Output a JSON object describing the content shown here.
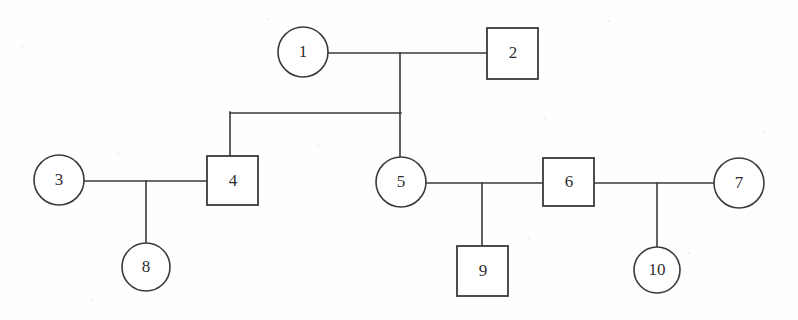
{
  "diagram": {
    "kind": "pedigree-genogram",
    "background_color": "#fefefe",
    "line_color": "#3a3a3c",
    "shape_fill": "#ffffff",
    "label_color": "#2e2e30",
    "symbol_legend": {
      "circle": "female",
      "square": "male"
    },
    "nodes": [
      {
        "id": "1",
        "label": "1",
        "shape": "circle",
        "sex": "female",
        "cx": 303,
        "cy": 52,
        "r": 25
      },
      {
        "id": "2",
        "label": "2",
        "shape": "square",
        "sex": "male",
        "x": 487,
        "y": 28,
        "w": 51,
        "h": 51
      },
      {
        "id": "3",
        "label": "3",
        "shape": "circle",
        "sex": "female",
        "cx": 59,
        "cy": 180,
        "r": 25
      },
      {
        "id": "4",
        "label": "4",
        "shape": "square",
        "sex": "male",
        "x": 207,
        "y": 156,
        "w": 51,
        "h": 49
      },
      {
        "id": "5",
        "label": "5",
        "shape": "circle",
        "sex": "female",
        "cx": 401,
        "cy": 182,
        "r": 25
      },
      {
        "id": "6",
        "label": "6",
        "shape": "square",
        "sex": "male",
        "x": 543,
        "y": 158,
        "w": 51,
        "h": 48
      },
      {
        "id": "7",
        "label": "7",
        "shape": "circle",
        "sex": "female",
        "cx": 739,
        "cy": 183,
        "r": 25
      },
      {
        "id": "8",
        "label": "8",
        "shape": "circle",
        "sex": "female",
        "cx": 146,
        "cy": 267,
        "r": 24
      },
      {
        "id": "9",
        "label": "9",
        "shape": "square",
        "sex": "male",
        "x": 457,
        "y": 246,
        "w": 51,
        "h": 50
      },
      {
        "id": "10",
        "label": "10",
        "shape": "circle",
        "sex": "female",
        "cx": 657,
        "cy": 270,
        "r": 23
      }
    ],
    "unions": [
      {
        "id": "union-1-2",
        "partners": [
          "1",
          "2"
        ],
        "children": [
          "4",
          "5"
        ]
      },
      {
        "id": "union-3-4",
        "partners": [
          "3",
          "4"
        ],
        "children": [
          "8"
        ]
      },
      {
        "id": "union-5-6",
        "partners": [
          "5",
          "6"
        ],
        "children": [
          "9"
        ]
      },
      {
        "id": "union-6-7",
        "partners": [
          "6",
          "7"
        ],
        "children": [
          "10"
        ]
      }
    ],
    "edges": [
      {
        "name": "mating-line-1-2",
        "type": "horizontal",
        "points": "328,53 487,53"
      },
      {
        "name": "descent-line-1-2",
        "type": "vertical",
        "points": "400,53 400,157"
      },
      {
        "name": "sibship-line-4-5",
        "type": "horizontal",
        "points": "230,113 400,113"
      },
      {
        "name": "sibship-drop-4",
        "type": "vertical",
        "points": "230,113 230,156"
      },
      {
        "name": "mating-line-3-4",
        "type": "horizontal",
        "points": "84,181 207,181"
      },
      {
        "name": "descent-line-8",
        "type": "vertical",
        "points": "146,181 146,243"
      },
      {
        "name": "mating-line-5-6",
        "type": "horizontal",
        "points": "426,183 543,183"
      },
      {
        "name": "descent-line-9",
        "type": "vertical",
        "points": "482,183 482,246"
      },
      {
        "name": "mating-line-6-7",
        "type": "horizontal",
        "points": "594,183 714,183"
      },
      {
        "name": "descent-line-10",
        "type": "vertical",
        "points": "657,183 657,247"
      }
    ]
  }
}
